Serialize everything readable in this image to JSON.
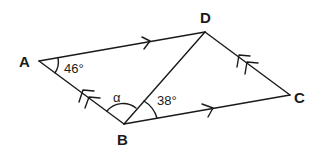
{
  "diagram": {
    "vertices": {
      "A": {
        "label": "A",
        "x": 39,
        "y": 61
      },
      "B": {
        "label": "B",
        "x": 124,
        "y": 124
      },
      "C": {
        "label": "C",
        "x": 290,
        "y": 95
      },
      "D": {
        "label": "D",
        "x": 205,
        "y": 32
      }
    },
    "angles": {
      "A": "46°",
      "alpha": "α",
      "DBC": "38°"
    },
    "stroke_color": "#1a1a1a"
  }
}
